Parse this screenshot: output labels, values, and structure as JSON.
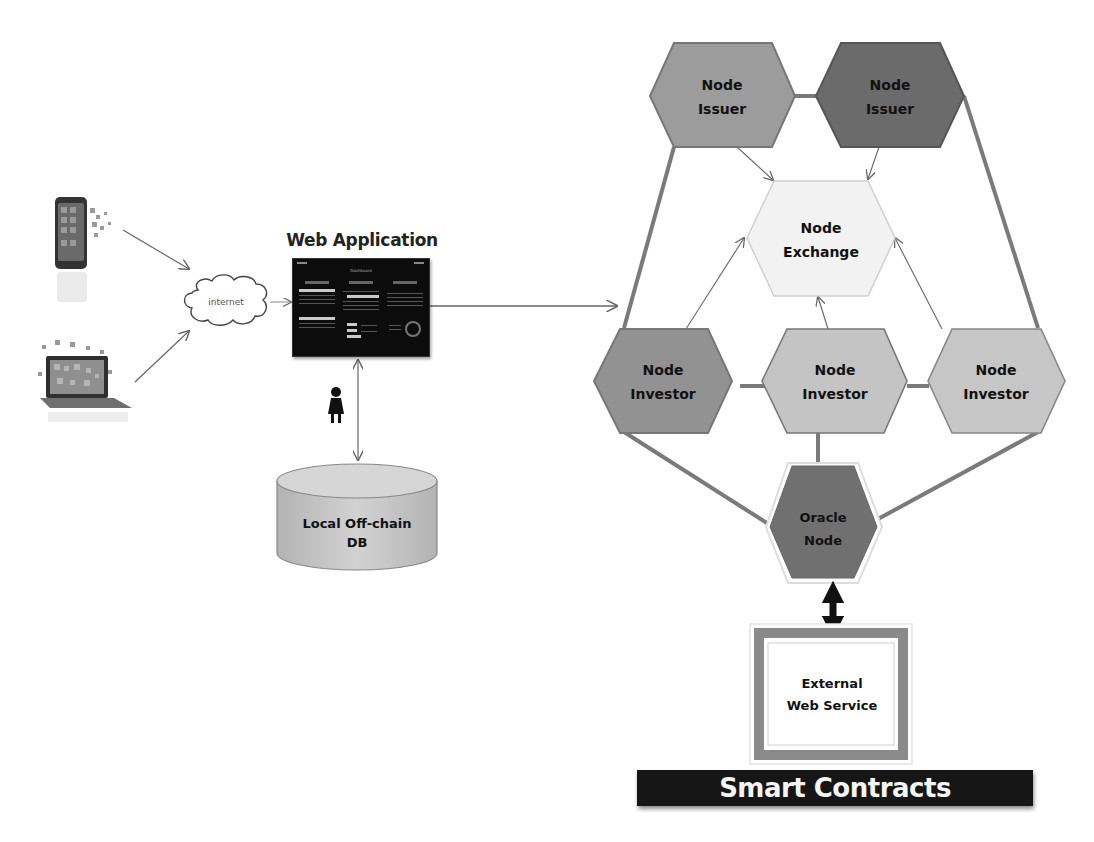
{
  "diagram": {
    "clients": [
      {
        "name": "mobile-phone",
        "icon": "smartphone-icon"
      },
      {
        "name": "laptop",
        "icon": "laptop-icon"
      }
    ],
    "internet": {
      "label": "internet"
    },
    "web_app": {
      "title": "Web Application",
      "screenshot_caption": "Dashboard"
    },
    "user": {
      "icon": "person-icon"
    },
    "database": {
      "line1": "Local Off-chain",
      "line2": "DB"
    },
    "nodes": {
      "issuer_left": {
        "line1": "Node",
        "line2": "Issuer",
        "color": "#9c9c9c"
      },
      "issuer_right": {
        "line1": "Node",
        "line2": "Issuer",
        "color": "#6b6b6b"
      },
      "exchange": {
        "line1": "Node",
        "line2": "Exchange",
        "color": "#f2f2f2"
      },
      "investor_left": {
        "line1": "Node",
        "line2": "Investor",
        "color": "#929292"
      },
      "investor_mid": {
        "line1": "Node",
        "line2": "Investor",
        "color": "#c4c4c4"
      },
      "investor_right": {
        "line1": "Node",
        "line2": "Investor",
        "color": "#c6c6c6"
      },
      "oracle": {
        "line1": "Oracle",
        "line2": "Node",
        "color": "#707070"
      }
    },
    "external_service": {
      "line1": "External",
      "line2": "Web Service"
    },
    "smart_contracts": {
      "label": "Smart Contracts"
    },
    "colors": {
      "connector": "#7a7a7a",
      "thin_arrow": "#666666",
      "db_fill": "#c9c9c9",
      "bar_bg": "#161616"
    }
  }
}
